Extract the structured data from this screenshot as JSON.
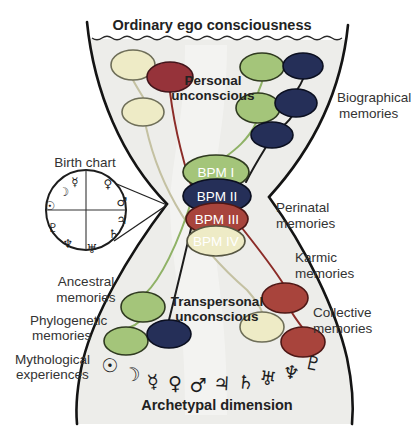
{
  "title": "Ordinary ego consciousness",
  "labels": {
    "personal": {
      "l1": "Personal",
      "l2": "unconscious"
    },
    "transpersonal": {
      "l1": "Transpersonal",
      "l2": "unconscious"
    },
    "biographical": {
      "l1": "Biographical",
      "l2": "memories"
    },
    "perinatal": {
      "l1": "Perinatal",
      "l2": "memories"
    },
    "karmic": {
      "l1": "Karmic",
      "l2": "memories"
    },
    "collective": {
      "l1": "Collective",
      "l2": "memories"
    },
    "ancestral": {
      "l1": "Ancestral",
      "l2": "memories"
    },
    "phylogenetic": {
      "l1": "Phylogenetic",
      "l2": "memories"
    },
    "mythological": {
      "l1": "Mythological",
      "l2": "experiences"
    },
    "archetypal": "Archetypal dimension",
    "birth_chart": "Birth chart"
  },
  "bpm": [
    "BPM I",
    "BPM II",
    "BPM III",
    "BPM IV"
  ],
  "chart_glyphs": {
    "sun": "☉",
    "moon": "☽",
    "mercury": "☿",
    "venus": "♀",
    "mars": "♂",
    "jupiter": "♃",
    "saturn": "♄",
    "uranus": "♅",
    "neptune": "♆",
    "pluto": "♇"
  },
  "planets": {
    "sun": "☉",
    "moon": "☽",
    "mercury": "☿",
    "venus": "♀",
    "mars": "♂",
    "jupiter": "♃",
    "saturn": "♄",
    "uranus": "♅",
    "neptune": "♆",
    "pluto": "♇"
  },
  "colors": {
    "pale_yellow": "#eeebc6",
    "light_green": "#a4c57a",
    "dark_navy": "#252f58",
    "brick_red": "#a8443c",
    "maroon": "#96333a",
    "vessel_fill": "#ededea"
  }
}
